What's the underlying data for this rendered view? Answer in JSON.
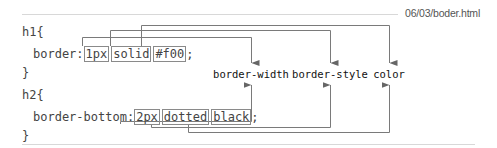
{
  "file": {
    "path": "06/03/boder.html"
  },
  "code": {
    "h1": {
      "open": "h1{",
      "property": "border:",
      "values": [
        "1px",
        "solid",
        "#f00"
      ],
      "terminator": ";",
      "close": "}"
    },
    "h2": {
      "open": "h2{",
      "property": "border-bottom:",
      "values": [
        "2px",
        "dotted",
        "black"
      ],
      "terminator": ";",
      "close": "}"
    }
  },
  "labels": [
    "border-width",
    "border-style",
    "color"
  ],
  "colors": {
    "line": "#7a7a7a",
    "rule": "#d8d8d8",
    "text": "#444444"
  }
}
